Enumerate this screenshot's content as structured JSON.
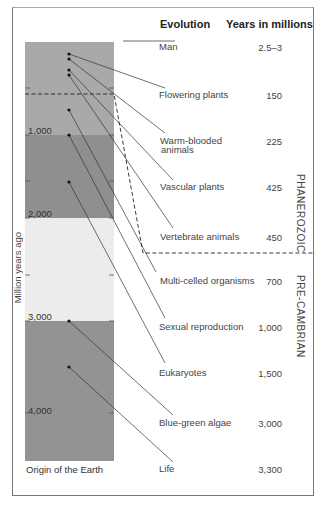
{
  "header": {
    "evolution": "Evolution",
    "years": "Years in millions"
  },
  "axis": {
    "label": "Million years ago",
    "ticks": [
      "1,000",
      "2,000",
      "3,000",
      "4,000"
    ],
    "bottom_label": "Origin of the Earth"
  },
  "eras": {
    "upper": "PHANEROZOIC",
    "lower": "PRE-CAMBRIAN"
  },
  "events": [
    {
      "name": "Man",
      "years": "2.5–3"
    },
    {
      "name": "Flowering plants",
      "years": "150"
    },
    {
      "name": "Warm-blooded",
      "name2": "animals",
      "years": "225"
    },
    {
      "name": "Vascular plants",
      "years": "425"
    },
    {
      "name": "Vertebrate animals",
      "years": "450"
    },
    {
      "name": "Multi-celled organisms",
      "years": "700"
    },
    {
      "name": "Sexual reproduction",
      "years": "1,000"
    },
    {
      "name": "Eukaryotes",
      "years": "1,500"
    },
    {
      "name": "Blue-green algae",
      "years": "3,000"
    },
    {
      "name": "Life",
      "years": "3,300"
    }
  ],
  "colors": {
    "band_light_mid": "#a9a9a9",
    "band_dark": "#8e8e8e",
    "band_pale": "#ececec"
  }
}
